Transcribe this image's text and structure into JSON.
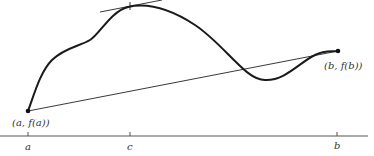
{
  "diagram": {
    "labels": {
      "point_a": "(a, f(a))",
      "point_b": "(b, f(b))",
      "tick_a": "a",
      "tick_c": "c",
      "tick_b": "b"
    },
    "colors": {
      "curve": "#1a1a1a",
      "line": "#222222",
      "axis": "#444444"
    }
  }
}
